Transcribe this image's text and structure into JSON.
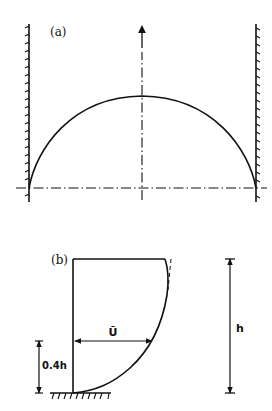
{
  "figure": {
    "panel_a": {
      "label": "(a)",
      "description": "Cross-channel velocity profile between two walls, semi-elliptic shape with centerline arrow",
      "colors": {
        "line": "#111111",
        "background": "#ffffff"
      }
    },
    "panel_b": {
      "label": "(b)",
      "mean_velocity_label": "Ū",
      "mean_height_label": "0.4h",
      "depth_label": "h",
      "description": "Vertical velocity profile over a rough bed; mean velocity occurs at 0.4h above bed"
    }
  }
}
